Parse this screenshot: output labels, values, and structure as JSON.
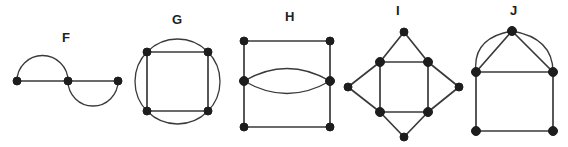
{
  "figure": {
    "title": "",
    "background_color": "#ffffff",
    "edge_color": "#3a3a3a",
    "vertex_color": "#1d1d1d",
    "label_color": "#222222",
    "width": 568,
    "height": 147
  },
  "graphs": [
    {
      "id": "F",
      "label": "F",
      "label_x": 62,
      "label_y": 31,
      "description": "three collinear vertices, arc above left pair and arc below right pair forming two double edges",
      "vertex_count": 3,
      "edge_count": 4,
      "vertices": [
        {
          "name": "f-left",
          "x": 17,
          "y": 81
        },
        {
          "name": "f-middle",
          "x": 68,
          "y": 81
        },
        {
          "name": "f-right",
          "x": 118,
          "y": 81
        }
      ],
      "edges": [
        {
          "type": "line",
          "from": "f-left",
          "to": "f-middle"
        },
        {
          "type": "line",
          "from": "f-middle",
          "to": "f-right"
        },
        {
          "type": "arc-above",
          "from": "f-left",
          "to": "f-middle"
        },
        {
          "type": "arc-below",
          "from": "f-middle",
          "to": "f-right"
        }
      ]
    },
    {
      "id": "G",
      "label": "G",
      "label_x": 172,
      "label_y": 13,
      "description": "square inscribed in a circle, square corners lie on the circle",
      "vertex_count": 4,
      "edge_count": 8,
      "vertices": [
        {
          "name": "g-top-left",
          "x": 147,
          "y": 52
        },
        {
          "name": "g-top-right",
          "x": 208,
          "y": 52
        },
        {
          "name": "g-bottom-right",
          "x": 208,
          "y": 111
        },
        {
          "name": "g-bottom-left",
          "x": 147,
          "y": 111
        }
      ],
      "circle": {
        "cx": 177.5,
        "cy": 81.5,
        "r": 42.5
      },
      "edges": [
        {
          "type": "line",
          "from": "g-top-left",
          "to": "g-top-right"
        },
        {
          "type": "line",
          "from": "g-top-right",
          "to": "g-bottom-right"
        },
        {
          "type": "line",
          "from": "g-bottom-right",
          "to": "g-bottom-left"
        },
        {
          "type": "line",
          "from": "g-bottom-left",
          "to": "g-top-left"
        },
        {
          "type": "circle-arc",
          "from": "g-top-left",
          "to": "g-top-right"
        },
        {
          "type": "circle-arc",
          "from": "g-top-right",
          "to": "g-bottom-right"
        },
        {
          "type": "circle-arc",
          "from": "g-bottom-right",
          "to": "g-bottom-left"
        },
        {
          "type": "circle-arc",
          "from": "g-bottom-left",
          "to": "g-top-left"
        }
      ]
    },
    {
      "id": "H",
      "label": "H",
      "label_x": 285,
      "label_y": 10,
      "description": "square with two mid-side vertices joined by a lens of two arcs",
      "vertex_count": 6,
      "edge_count": 8,
      "vertices": [
        {
          "name": "h-top-left",
          "x": 244,
          "y": 41
        },
        {
          "name": "h-top-right",
          "x": 330,
          "y": 41
        },
        {
          "name": "h-mid-left",
          "x": 244,
          "y": 81
        },
        {
          "name": "h-mid-right",
          "x": 330,
          "y": 81
        },
        {
          "name": "h-bottom-left",
          "x": 244,
          "y": 127
        },
        {
          "name": "h-bottom-right",
          "x": 330,
          "y": 127
        }
      ],
      "edges": [
        {
          "type": "line",
          "from": "h-top-left",
          "to": "h-top-right"
        },
        {
          "type": "line",
          "from": "h-top-left",
          "to": "h-mid-left"
        },
        {
          "type": "line",
          "from": "h-mid-left",
          "to": "h-bottom-left"
        },
        {
          "type": "line",
          "from": "h-top-right",
          "to": "h-mid-right"
        },
        {
          "type": "line",
          "from": "h-mid-right",
          "to": "h-bottom-right"
        },
        {
          "type": "line",
          "from": "h-bottom-left",
          "to": "h-bottom-right"
        },
        {
          "type": "arc-above",
          "from": "h-mid-left",
          "to": "h-mid-right"
        },
        {
          "type": "arc-below",
          "from": "h-mid-left",
          "to": "h-mid-right"
        }
      ]
    },
    {
      "id": "I",
      "label": "I",
      "label_x": 396,
      "label_y": 4,
      "description": "four-pointed star: inner square with four outer apex vertices",
      "vertex_count": 8,
      "edge_count": 12,
      "vertices": [
        {
          "name": "i-top",
          "x": 404,
          "y": 32
        },
        {
          "name": "i-bottom",
          "x": 404,
          "y": 137
        },
        {
          "name": "i-left",
          "x": 348,
          "y": 87
        },
        {
          "name": "i-right",
          "x": 459,
          "y": 87
        },
        {
          "name": "i-inner-top-left",
          "x": 380,
          "y": 62
        },
        {
          "name": "i-inner-top-right",
          "x": 428,
          "y": 62
        },
        {
          "name": "i-inner-bottom-left",
          "x": 380,
          "y": 112
        },
        {
          "name": "i-inner-bottom-right",
          "x": 428,
          "y": 112
        }
      ],
      "edges": [
        {
          "type": "line",
          "from": "i-inner-top-left",
          "to": "i-inner-top-right"
        },
        {
          "type": "line",
          "from": "i-inner-top-right",
          "to": "i-inner-bottom-right"
        },
        {
          "type": "line",
          "from": "i-inner-bottom-right",
          "to": "i-inner-bottom-left"
        },
        {
          "type": "line",
          "from": "i-inner-bottom-left",
          "to": "i-inner-top-left"
        },
        {
          "type": "line",
          "from": "i-top",
          "to": "i-inner-top-left"
        },
        {
          "type": "line",
          "from": "i-top",
          "to": "i-inner-top-right"
        },
        {
          "type": "line",
          "from": "i-bottom",
          "to": "i-inner-bottom-left"
        },
        {
          "type": "line",
          "from": "i-bottom",
          "to": "i-inner-bottom-right"
        },
        {
          "type": "line",
          "from": "i-left",
          "to": "i-inner-top-left"
        },
        {
          "type": "line",
          "from": "i-left",
          "to": "i-inner-bottom-left"
        },
        {
          "type": "line",
          "from": "i-right",
          "to": "i-inner-top-right"
        },
        {
          "type": "line",
          "from": "i-right",
          "to": "i-inner-bottom-right"
        }
      ]
    },
    {
      "id": "J",
      "label": "J",
      "label_x": 510,
      "label_y": 4,
      "description": "square with apex vertex above, connected by straight edges and parallel outer arcs",
      "vertex_count": 5,
      "edge_count": 8,
      "vertices": [
        {
          "name": "j-apex",
          "x": 512,
          "y": 31
        },
        {
          "name": "j-top-left",
          "x": 476,
          "y": 72
        },
        {
          "name": "j-top-right",
          "x": 553,
          "y": 72
        },
        {
          "name": "j-bottom-left",
          "x": 476,
          "y": 131
        },
        {
          "name": "j-bottom-right",
          "x": 553,
          "y": 131
        }
      ],
      "edges": [
        {
          "type": "line",
          "from": "j-apex",
          "to": "j-top-left"
        },
        {
          "type": "line",
          "from": "j-apex",
          "to": "j-top-right"
        },
        {
          "type": "arc-outer",
          "from": "j-apex",
          "to": "j-top-left"
        },
        {
          "type": "arc-outer",
          "from": "j-apex",
          "to": "j-top-right"
        },
        {
          "type": "line",
          "from": "j-top-left",
          "to": "j-top-right"
        },
        {
          "type": "line",
          "from": "j-top-left",
          "to": "j-bottom-left"
        },
        {
          "type": "line",
          "from": "j-top-right",
          "to": "j-bottom-right"
        },
        {
          "type": "line",
          "from": "j-bottom-left",
          "to": "j-bottom-right"
        }
      ]
    }
  ]
}
